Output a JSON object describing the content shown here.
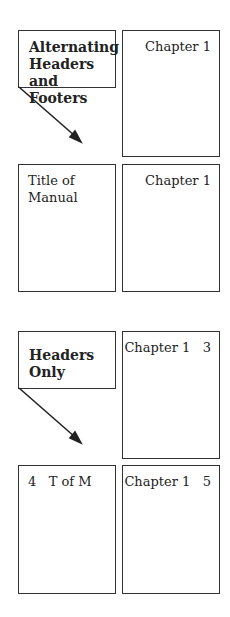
{
  "sections": [
    {
      "label": "Alternating Headers and Footers",
      "label_lines": [
        "Alternating",
        "Headers and",
        "Footers"
      ],
      "page_top_right": {
        "header": "Chapter 1"
      },
      "page_bottom_left": {
        "header_lines": [
          "Title of",
          "Manual"
        ]
      },
      "page_bottom_right": {
        "header": "Chapter 1"
      }
    },
    {
      "label": "Headers Only",
      "label_lines": [
        "Headers",
        "Only"
      ],
      "page_top_right": {
        "header": "Chapter 1",
        "page_number": "3"
      },
      "page_bottom_left": {
        "page_number": "4",
        "header": "T of M"
      },
      "page_bottom_right": {
        "header": "Chapter 1",
        "page_number": "5"
      }
    }
  ]
}
